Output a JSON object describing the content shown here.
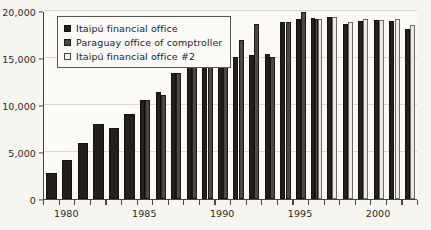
{
  "chart_data": {
    "type": "bar",
    "title": "",
    "subtitle": "",
    "xlabel": "",
    "ylabel": "",
    "ylim": [
      0,
      20000
    ],
    "yticks": [
      0,
      5000,
      10000,
      15000,
      20000
    ],
    "ytick_labels": [
      "0",
      "5,000",
      "10,000",
      "15,000",
      "20,000"
    ],
    "xtick_labels": [
      "1980",
      "1985",
      "1990",
      "1995",
      "2000"
    ],
    "xticks": [
      1980,
      1985,
      1990,
      1995,
      2000
    ],
    "grid": true,
    "legend_position": "upper-left",
    "categories": [
      1979,
      1980,
      1981,
      1982,
      1983,
      1984,
      1985,
      1986,
      1987,
      1988,
      1989,
      1990,
      1991,
      1992,
      1993,
      1994,
      1995,
      1996,
      1997,
      1998,
      1999,
      2000,
      2001,
      2002
    ],
    "series": [
      {
        "name": "Itaipú financial office",
        "color": "#231f1c",
        "values": [
          2750,
          4150,
          5950,
          7950,
          7550,
          9050,
          10500,
          11400,
          13400,
          15050,
          16650,
          16250,
          15150,
          15350,
          15450,
          18850,
          19100,
          19300,
          19400,
          18600,
          18950,
          19050,
          18950,
          18050
        ]
      },
      {
        "name": "Paraguay office of comptroller",
        "color": "#4d4843",
        "values": [
          null,
          null,
          null,
          null,
          null,
          null,
          10500,
          11100,
          13450,
          15050,
          16700,
          16900,
          16900,
          18600,
          15100,
          18850,
          19900,
          19100,
          null,
          null,
          null,
          null,
          null,
          null
        ]
      },
      {
        "name": "Itaipú financial office #2",
        "color": "#eceae4",
        "values": [
          null,
          null,
          null,
          null,
          null,
          null,
          null,
          null,
          null,
          null,
          null,
          null,
          null,
          null,
          null,
          null,
          null,
          19100,
          19400,
          18850,
          19150,
          19050,
          19200,
          18550
        ]
      }
    ]
  }
}
